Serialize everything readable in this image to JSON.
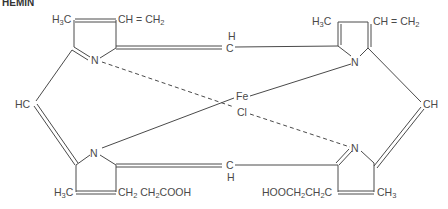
{
  "title": "HEMIN",
  "labels": {
    "tl_methyl": "H3C",
    "tl_vinyl": "CH=CH2",
    "tr_methyl": "H3C",
    "tr_vinyl": "CH=CH2",
    "top_meso_h": "H",
    "top_meso_c": "C",
    "left_meso": "HC",
    "right_meso": "CH",
    "fe": "Fe",
    "cl": "Cl",
    "bottom_meso_c": "C",
    "bottom_meso_h": "H",
    "bl_methyl": "H3C",
    "bl_propionic": "CH2CH2COOH",
    "br_propionic": "HOOCH2CH2C",
    "br_methyl": "CH3",
    "n_tl": "N",
    "n_tr": "N",
    "n_bl": "N",
    "n_br": "N"
  },
  "colors": {
    "ink": "#4a4a4a",
    "background": "#ffffff"
  }
}
